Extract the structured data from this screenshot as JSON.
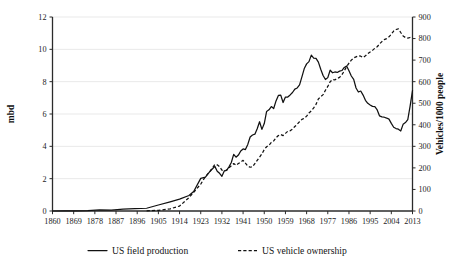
{
  "chart_data": {
    "type": "line",
    "title": "",
    "xlabel": "",
    "ylabel": "mbd",
    "y2label": "Vehicles/1000 people",
    "grid": true,
    "legend_position": "bottom",
    "xlim": [
      1860,
      2013
    ],
    "ylim": [
      0,
      12
    ],
    "y2lim": [
      0,
      900
    ],
    "xticks": [
      1860,
      1869,
      1878,
      1887,
      1896,
      1905,
      1914,
      1923,
      1932,
      1941,
      1950,
      1959,
      1968,
      1977,
      1986,
      1995,
      2004,
      2013
    ],
    "yticks": [
      0,
      2,
      4,
      6,
      8,
      10,
      12
    ],
    "y2ticks": [
      0,
      100,
      200,
      300,
      400,
      500,
      600,
      700,
      800,
      900
    ],
    "series": [
      {
        "name": "US field production",
        "axis": "left",
        "style": "solid",
        "units": "mbd",
        "x": [
          1860,
          1865,
          1870,
          1875,
          1880,
          1885,
          1890,
          1895,
          1900,
          1905,
          1910,
          1914,
          1918,
          1920,
          1923,
          1925,
          1927,
          1929,
          1930,
          1931,
          1932,
          1933,
          1934,
          1935,
          1936,
          1937,
          1938,
          1939,
          1940,
          1941,
          1942,
          1943,
          1944,
          1945,
          1946,
          1947,
          1948,
          1949,
          1950,
          1951,
          1952,
          1953,
          1954,
          1955,
          1956,
          1957,
          1958,
          1959,
          1960,
          1961,
          1962,
          1963,
          1964,
          1965,
          1966,
          1967,
          1968,
          1969,
          1970,
          1971,
          1972,
          1973,
          1974,
          1975,
          1976,
          1977,
          1978,
          1979,
          1980,
          1981,
          1982,
          1983,
          1984,
          1985,
          1986,
          1987,
          1988,
          1989,
          1990,
          1991,
          1992,
          1993,
          1994,
          1995,
          1996,
          1997,
          1998,
          1999,
          2000,
          2001,
          2002,
          2003,
          2004,
          2005,
          2006,
          2007,
          2008,
          2009,
          2010,
          2011,
          2012,
          2013
        ],
        "y": [
          0.0,
          0.01,
          0.01,
          0.03,
          0.07,
          0.06,
          0.12,
          0.14,
          0.17,
          0.37,
          0.57,
          0.73,
          0.96,
          1.21,
          2.02,
          2.09,
          2.46,
          2.76,
          2.46,
          2.33,
          2.15,
          2.48,
          2.51,
          2.73,
          3.0,
          3.5,
          3.33,
          3.46,
          3.71,
          3.84,
          3.8,
          4.12,
          4.58,
          4.7,
          4.75,
          5.09,
          5.52,
          5.05,
          5.41,
          6.16,
          6.26,
          6.46,
          6.34,
          6.81,
          7.15,
          7.17,
          6.71,
          7.05,
          7.05,
          7.18,
          7.33,
          7.54,
          7.61,
          7.8,
          8.3,
          8.81,
          9.1,
          9.24,
          9.64,
          9.46,
          9.44,
          9.21,
          8.77,
          8.38,
          8.13,
          8.25,
          8.71,
          8.55,
          8.6,
          8.57,
          8.65,
          8.69,
          8.88,
          8.97,
          8.68,
          8.35,
          8.14,
          7.61,
          7.36,
          7.42,
          7.17,
          6.85,
          6.66,
          6.56,
          6.47,
          6.45,
          6.25,
          5.88,
          5.82,
          5.8,
          5.75,
          5.68,
          5.42,
          5.18,
          5.1,
          5.06,
          4.95,
          5.36,
          5.47,
          5.65,
          6.5,
          7.45
        ]
      },
      {
        "name": "US vehicle ownership",
        "axis": "right",
        "style": "dashed",
        "units": "vehicles per 1000 people",
        "x": [
          1900,
          1905,
          1910,
          1914,
          1918,
          1920,
          1923,
          1925,
          1927,
          1929,
          1930,
          1931,
          1932,
          1933,
          1934,
          1935,
          1936,
          1937,
          1938,
          1939,
          1940,
          1941,
          1942,
          1943,
          1944,
          1945,
          1946,
          1947,
          1948,
          1949,
          1950,
          1951,
          1952,
          1953,
          1954,
          1955,
          1956,
          1957,
          1958,
          1959,
          1960,
          1961,
          1962,
          1963,
          1964,
          1965,
          1966,
          1967,
          1968,
          1969,
          1970,
          1971,
          1972,
          1973,
          1974,
          1975,
          1976,
          1977,
          1978,
          1979,
          1980,
          1981,
          1982,
          1983,
          1984,
          1985,
          1986,
          1987,
          1988,
          1989,
          1990,
          1991,
          1992,
          1993,
          1994,
          1995,
          1996,
          1997,
          1998,
          1999,
          2000,
          2001,
          2002,
          2003,
          2004,
          2005,
          2006,
          2007,
          2008,
          2009,
          2010,
          2011,
          2012,
          2013
        ],
        "y": [
          1,
          3,
          10,
          23,
          62,
          87,
          125,
          160,
          185,
          216,
          214,
          206,
          190,
          186,
          190,
          200,
          210,
          220,
          212,
          220,
          227,
          235,
          222,
          208,
          203,
          205,
          220,
          235,
          250,
          265,
          285,
          298,
          305,
          318,
          325,
          340,
          350,
          355,
          350,
          360,
          370,
          372,
          380,
          392,
          402,
          415,
          425,
          430,
          440,
          455,
          465,
          478,
          495,
          520,
          530,
          540,
          560,
          578,
          600,
          610,
          608,
          615,
          620,
          632,
          650,
          670,
          686,
          700,
          710,
          715,
          720,
          718,
          712,
          720,
          730,
          738,
          745,
          755,
          762,
          775,
          786,
          795,
          800,
          808,
          820,
          835,
          842,
          845,
          828,
          812,
          805,
          802,
          805,
          808
        ]
      }
    ]
  },
  "legend": {
    "entries": [
      {
        "label": "US field production",
        "style": "solid"
      },
      {
        "label": "US vehicle ownership",
        "style": "dashed"
      }
    ]
  }
}
